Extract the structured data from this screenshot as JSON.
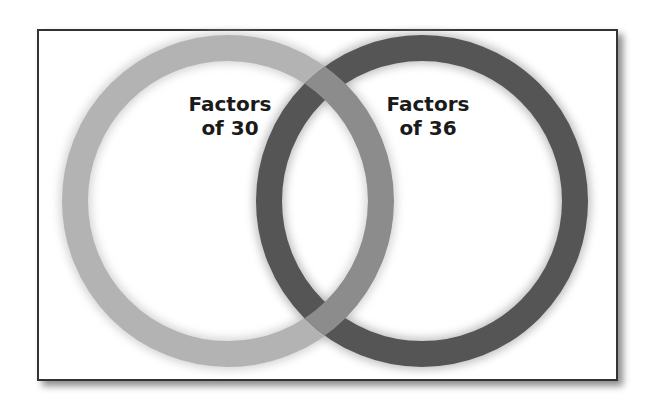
{
  "diagram": {
    "type": "venn",
    "sets": [
      {
        "label_line1": "Factors",
        "label_line2": "of 30",
        "color": "#b3b3b3"
      },
      {
        "label_line1": "Factors",
        "label_line2": "of 36",
        "color": "#555555"
      }
    ],
    "overlap_color": "#8c8c8c"
  }
}
